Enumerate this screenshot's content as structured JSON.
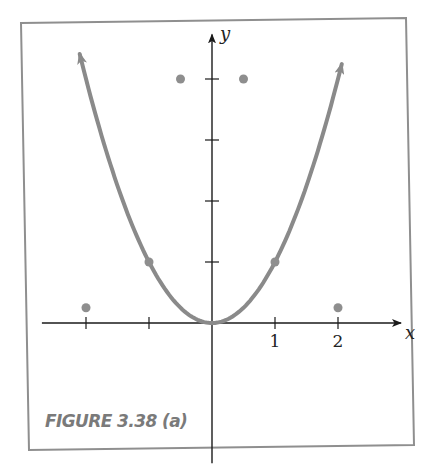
{
  "figure": {
    "caption": "FIGURE 3.38 (a)",
    "frame_color": "#8f8f8f",
    "curve_color": "#8a8a8a",
    "point_color": "#8e8e8e",
    "axis_color": "#1a1a1a",
    "caption_color": "#7a7a7a"
  },
  "chart_data": {
    "type": "line",
    "title": "",
    "xlabel": "x",
    "ylabel": "y",
    "x_tick_labels": [
      "1",
      "2"
    ],
    "x_ticks": [
      -2,
      -1,
      0,
      1,
      2
    ],
    "y_ticks": [
      1,
      2,
      3,
      4
    ],
    "xlim": [
      -2.7,
      3.0
    ],
    "ylim": [
      -2.3,
      4.6
    ],
    "grid": false,
    "legend": null,
    "series": [
      {
        "name": "y = x^2",
        "kind": "curve",
        "function": "x^2",
        "domain": [
          -2.1,
          2.06
        ],
        "arrows": "both-ends",
        "marked_points": [
          [
            -1,
            1
          ],
          [
            1,
            1
          ]
        ]
      },
      {
        "name": "isolated points",
        "kind": "scatter",
        "points": [
          [
            -2,
            0.25
          ],
          [
            -0.5,
            4
          ],
          [
            0.5,
            4
          ],
          [
            2,
            0.25
          ]
        ]
      }
    ]
  }
}
